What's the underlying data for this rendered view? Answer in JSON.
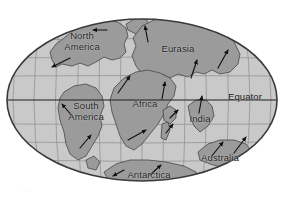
{
  "figure": {
    "type": "world-map",
    "projection": "oval (Mollweide-like) world projection"
  },
  "colors": {
    "background": "#ffffff",
    "ocean": "#c9c9c9",
    "land": "#9b9b9b",
    "land_outline": "#4a4a4a",
    "graticule": "#8e8e8e",
    "ellipse_border": "#3a3a3a",
    "equator_line": "#1e1e1e",
    "arrow": "#111111",
    "label_text": "#1b1b1b"
  },
  "map": {
    "ellipse": {
      "cx": 142,
      "cy": 100,
      "rx": 136,
      "ry": 82
    },
    "graticule": {
      "parallels": [
        22,
        40,
        58,
        76,
        100,
        124,
        142,
        160,
        178
      ],
      "meridian_count": 13,
      "equator_y": 100,
      "grid_visible": true
    },
    "continents": [
      {
        "name": "north-america",
        "label": "North\nAmerica",
        "label_x": 82,
        "label_y": 36,
        "drift_arrows": [
          {
            "name": "arrow-north-america-west",
            "x1": 107,
            "y1": 30,
            "x2": 93,
            "y2": 30
          },
          {
            "name": "arrow-north-america-southwest",
            "x1": 70,
            "y1": 58,
            "x2": 52,
            "y2": 67
          }
        ]
      },
      {
        "name": "eurasia",
        "label": "Eurasia",
        "label_x": 178,
        "label_y": 49,
        "drift_arrows": [
          {
            "name": "arrow-eurasia-north",
            "x1": 148,
            "y1": 42,
            "x2": 145,
            "y2": 26
          },
          {
            "name": "arrow-eurasia-northeast",
            "x1": 218,
            "y1": 68,
            "x2": 228,
            "y2": 50
          },
          {
            "name": "arrow-eurasia-north-central",
            "x1": 191,
            "y1": 78,
            "x2": 197,
            "y2": 60
          }
        ]
      },
      {
        "name": "africa",
        "label": "Africa",
        "label_x": 145,
        "label_y": 104,
        "drift_arrows": [
          {
            "name": "arrow-africa-northeast",
            "x1": 118,
            "y1": 93,
            "x2": 130,
            "y2": 76
          },
          {
            "name": "arrow-africa-north",
            "x1": 162,
            "y1": 99,
            "x2": 165,
            "y2": 82
          },
          {
            "name": "arrow-africa-southeast",
            "x1": 128,
            "y1": 140,
            "x2": 146,
            "y2": 130
          }
        ]
      },
      {
        "name": "south-america",
        "label": "South\nAmerica",
        "label_x": 85,
        "label_y": 106,
        "drift_arrows": [
          {
            "name": "arrow-south-america-northwest",
            "x1": 73,
            "y1": 117,
            "x2": 62,
            "y2": 104
          },
          {
            "name": "arrow-south-america-northeast",
            "x1": 80,
            "y1": 148,
            "x2": 91,
            "y2": 135
          }
        ]
      },
      {
        "name": "india",
        "label": "India",
        "label_x": 200,
        "label_y": 119,
        "drift_arrows": [
          {
            "name": "arrow-india-north",
            "x1": 199,
            "y1": 113,
            "x2": 202,
            "y2": 96
          }
        ]
      },
      {
        "name": "australia",
        "label": "Australia",
        "label_x": 219,
        "label_y": 158,
        "drift_arrows": [
          {
            "name": "arrow-australia-northeast-left",
            "x1": 211,
            "y1": 157,
            "x2": 223,
            "y2": 142
          },
          {
            "name": "arrow-australia-northeast-right",
            "x1": 234,
            "y1": 153,
            "x2": 246,
            "y2": 137
          }
        ]
      },
      {
        "name": "antarctica",
        "label": "Antarctica",
        "label_x": 148,
        "label_y": 175,
        "drift_arrows": [
          {
            "name": "arrow-antarctica-southwest",
            "x1": 124,
            "y1": 170,
            "x2": 113,
            "y2": 176
          },
          {
            "name": "arrow-antarctica-northeast",
            "x1": 150,
            "y1": 175,
            "x2": 161,
            "y2": 165
          }
        ]
      },
      {
        "name": "madagascar-arabia-islands",
        "label": "",
        "drift_arrows": [
          {
            "name": "arrow-arabia-northeast",
            "x1": 170,
            "y1": 118,
            "x2": 178,
            "y2": 110
          },
          {
            "name": "arrow-madagascar-northeast",
            "x1": 166,
            "y1": 133,
            "x2": 173,
            "y2": 124
          }
        ]
      }
    ],
    "annotations": [
      {
        "name": "equator-label",
        "text": "Equator",
        "x": 252,
        "y": 97
      }
    ]
  },
  "caption": {
    "remnant_text": "⸱⸱  ⸱"
  }
}
